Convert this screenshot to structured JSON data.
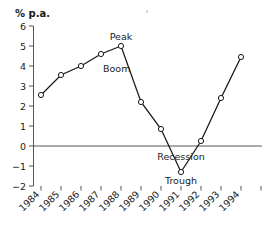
{
  "chart_data": {
    "type": "line",
    "title": "",
    "subtitle": "",
    "xlabel": "",
    "ylabel": "% p.a.",
    "ylabel_position": "top-left",
    "grid": false,
    "legend": "none",
    "ylim": [
      -2,
      6
    ],
    "ytick_labels": [
      "6",
      "5",
      "4",
      "3",
      "2",
      "1",
      "0",
      "−1",
      "−2"
    ],
    "ytick_values": [
      6,
      5,
      4,
      3,
      2,
      1,
      0,
      -1,
      -2
    ],
    "categories": [
      "1984",
      "1985",
      "1986",
      "1987",
      "1988",
      "1989",
      "1990",
      "1991",
      "1992",
      "1993",
      "1994"
    ],
    "x": [
      1984,
      1985,
      1986,
      1987,
      1988,
      1989,
      1990,
      1991,
      1992,
      1993,
      1994
    ],
    "values": [
      2.55,
      3.55,
      4.0,
      4.6,
      5.0,
      2.2,
      0.85,
      -1.3,
      0.25,
      2.4,
      4.45
    ],
    "series": [
      {
        "name": "Growth rate",
        "values": [
          2.55,
          3.55,
          4.0,
          4.6,
          5.0,
          2.2,
          0.85,
          -1.3,
          0.25,
          2.4,
          4.45
        ]
      }
    ],
    "markers": "open-circle",
    "zero_line": true,
    "xtick_count": 12,
    "annotations": [
      {
        "id": "peak",
        "text": "Peak",
        "at_category": "1988",
        "at_value": 5.0,
        "placement": "above"
      },
      {
        "id": "boom",
        "text": "Boom",
        "at_category": "1987",
        "at_value": 4.6,
        "placement": "below-right"
      },
      {
        "id": "recession",
        "text": "Recession",
        "at_category": "1991",
        "at_value": 0.0,
        "placement": "below"
      },
      {
        "id": "trough",
        "text": "Trough",
        "at_category": "1991",
        "at_value": -1.3,
        "placement": "below"
      }
    ]
  },
  "colors": {
    "line": "#1a1a1a",
    "marker_fill": "#ffffff",
    "axis": "#555555",
    "text": "#1a1a1a",
    "background": "#ffffff"
  },
  "axis": {
    "y_title": "% p.a."
  },
  "labels": {
    "peak": "Peak",
    "boom": "Boom",
    "recession": "Recession",
    "trough": "Trough"
  }
}
